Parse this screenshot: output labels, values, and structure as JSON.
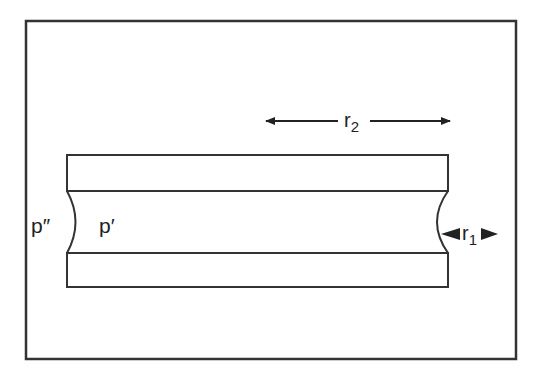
{
  "diagram": {
    "type": "capillary-meniscus-between-plates",
    "labels": {
      "r2": "r",
      "r2_sub": "2",
      "r1": "r",
      "r1_sub": "1",
      "p_outside": "p″",
      "p_inside": "p′"
    },
    "colors": {
      "stroke": "#333333",
      "background": "#ffffff"
    }
  }
}
